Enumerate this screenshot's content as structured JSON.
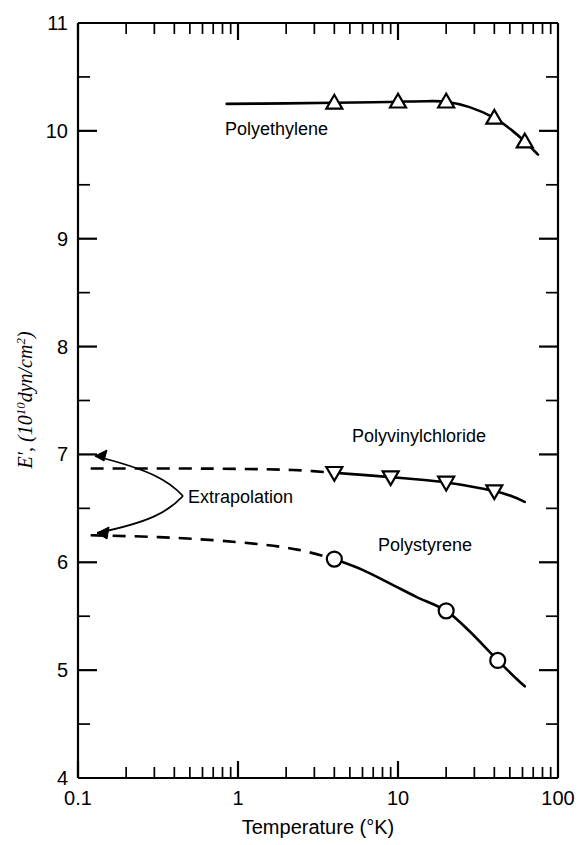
{
  "chart_data": {
    "type": "line",
    "title": "",
    "xlabel": "Temperature (°K)",
    "ylabel": "E′, (10¹⁰ dyn/cm²)",
    "xscale": "log",
    "yscale": "linear",
    "xlim": [
      0.1,
      100
    ],
    "ylim": [
      4,
      11
    ],
    "grid": false,
    "legend_position": "inline-labels",
    "xticks": [
      "0.1",
      "1",
      "10",
      "100"
    ],
    "xtick_values": [
      0.1,
      1,
      10,
      100
    ],
    "yticks": [
      "4",
      "5",
      "6",
      "7",
      "8",
      "9",
      "10",
      "11"
    ],
    "ytick_values": [
      4,
      5,
      6,
      7,
      8,
      9,
      10,
      11
    ],
    "yminor_values": [
      4.5,
      5.5,
      6.5,
      7.5,
      8.5,
      9.5,
      10.5
    ],
    "series": [
      {
        "name": "Polyethylene",
        "marker": "triangle-up",
        "linestyle": "solid",
        "label_text": "Polyethylene",
        "x": [
          0.85,
          4.0,
          10.0,
          20.0,
          40.0,
          62.0
        ],
        "y": [
          10.25,
          10.26,
          10.27,
          10.27,
          10.12,
          9.9
        ],
        "solid_points": [
          [
            0.85,
            10.25
          ],
          [
            2.0,
            10.255
          ],
          [
            4.0,
            10.26
          ],
          [
            7.0,
            10.265
          ],
          [
            10.0,
            10.27
          ],
          [
            15.0,
            10.275
          ],
          [
            20.0,
            10.27
          ],
          [
            28.0,
            10.22
          ],
          [
            40.0,
            10.12
          ],
          [
            52.0,
            10.0
          ],
          [
            62.0,
            9.9
          ],
          [
            75.0,
            9.78
          ]
        ],
        "marker_points": [
          [
            4.0,
            10.26
          ],
          [
            10.0,
            10.27
          ],
          [
            20.0,
            10.27
          ],
          [
            40.0,
            10.12
          ],
          [
            62.0,
            9.9
          ]
        ]
      },
      {
        "name": "Polyvinylchloride",
        "marker": "triangle-down",
        "linestyle": "solid-with-dashed-extrapolation",
        "label_text": "Polyvinylchloride",
        "x": [
          0.12,
          4.0,
          9.0,
          20.0,
          40.0,
          62.0
        ],
        "y": [
          6.87,
          6.83,
          6.79,
          6.74,
          6.66,
          6.56
        ],
        "dashed_points": [
          [
            0.12,
            6.87
          ],
          [
            0.3,
            6.87
          ],
          [
            0.7,
            6.868
          ],
          [
            1.5,
            6.862
          ],
          [
            2.5,
            6.852
          ],
          [
            4.0,
            6.83
          ]
        ],
        "solid_points": [
          [
            4.0,
            6.83
          ],
          [
            6.0,
            6.81
          ],
          [
            9.0,
            6.79
          ],
          [
            14.0,
            6.765
          ],
          [
            20.0,
            6.74
          ],
          [
            28.0,
            6.705
          ],
          [
            40.0,
            6.66
          ],
          [
            52.0,
            6.61
          ],
          [
            62.0,
            6.56
          ]
        ],
        "marker_points": [
          [
            4.0,
            6.83
          ],
          [
            9.0,
            6.79
          ],
          [
            20.0,
            6.74
          ],
          [
            40.0,
            6.66
          ]
        ]
      },
      {
        "name": "Polystyrene",
        "marker": "circle",
        "linestyle": "solid-with-dashed-extrapolation",
        "label_text": "Polystyrene",
        "x": [
          0.12,
          4.0,
          20.0,
          42.0,
          62.0
        ],
        "y": [
          6.25,
          6.03,
          5.55,
          5.09,
          4.85
        ],
        "dashed_points": [
          [
            0.12,
            6.25
          ],
          [
            0.3,
            6.235
          ],
          [
            0.7,
            6.205
          ],
          [
            1.4,
            6.165
          ],
          [
            2.4,
            6.115
          ],
          [
            4.0,
            6.03
          ]
        ],
        "solid_points": [
          [
            4.0,
            6.03
          ],
          [
            6.0,
            5.93
          ],
          [
            9.0,
            5.8
          ],
          [
            13.0,
            5.68
          ],
          [
            20.0,
            5.55
          ],
          [
            28.0,
            5.36
          ],
          [
            42.0,
            5.09
          ],
          [
            55.0,
            4.92
          ],
          [
            62.0,
            4.85
          ]
        ],
        "marker_points": [
          [
            4.0,
            6.03
          ],
          [
            20.0,
            5.55
          ],
          [
            42.0,
            5.09
          ]
        ]
      }
    ],
    "annotations": [
      {
        "name": "extrapolation",
        "text": "Extrapolation",
        "points_to": [
          [
            0.13,
            6.87
          ],
          [
            0.13,
            6.25
          ]
        ]
      }
    ],
    "colors": {
      "line": "#000000",
      "marker_fill": "#ffffff",
      "background": "#ffffff",
      "axis": "#000000"
    }
  }
}
